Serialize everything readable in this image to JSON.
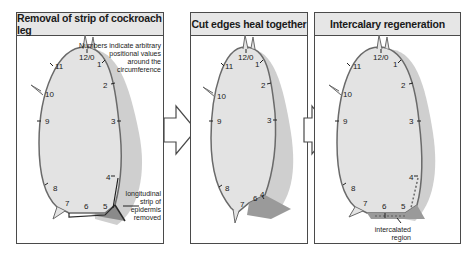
{
  "panels": [
    {
      "title": "Removal of strip of cockroach leg",
      "note_lines": [
        "Numbers indicate arbitrary",
        "positional values",
        "around the",
        "circumference"
      ],
      "callout_lines": [
        "longitudinal",
        "strip of",
        "epidermis",
        "removed"
      ]
    },
    {
      "title": "Cut edges heal together"
    },
    {
      "title": "Intercalary regeneration",
      "callout_lines": [
        "intercalated",
        "region"
      ]
    }
  ],
  "positional_values": {
    "p1": [
      "12/0",
      "1",
      "2",
      "3",
      "4",
      "5",
      "6",
      "7",
      "8",
      "9",
      "10",
      "11"
    ],
    "p2": [
      "12/0",
      "1",
      "2",
      "3",
      "4",
      "6",
      "7",
      "8",
      "9",
      "10",
      "11"
    ],
    "p3": [
      "12/0",
      "1",
      "2",
      "3",
      "4",
      "5",
      "6",
      "7",
      "8",
      "9",
      "10",
      "11"
    ]
  },
  "colors": {
    "leg_fill": "#e3e3e3",
    "leg_outline": "#6a6a6a",
    "shadow": "#c8c8c8",
    "cut_face": "#9a9a9a",
    "header_bg": "#e6e6e6",
    "border": "#4a4a4a"
  }
}
